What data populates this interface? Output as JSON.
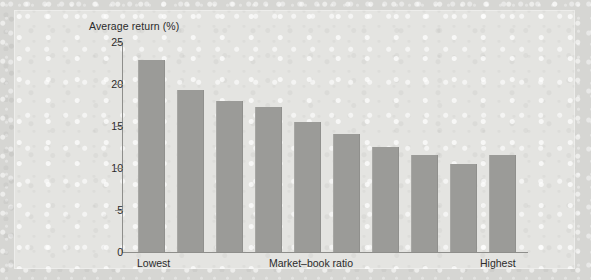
{
  "figure": {
    "background_color": "#d6d6d3",
    "panel_color": "#e4e4e1",
    "bar_color": "#9b9b98",
    "axis_color": "#8e8e8b"
  },
  "chart_data": {
    "type": "bar",
    "title": "",
    "ylabel": "Average return (%)",
    "xlabel": "Market–book ratio",
    "ylim": [
      0,
      25
    ],
    "yticks": [
      0,
      5,
      10,
      15,
      20,
      25
    ],
    "ytick_labels": [
      "0",
      "5",
      "10",
      "15",
      "20",
      "25"
    ],
    "grid": false,
    "legend": null,
    "x_axis_endpoint_labels": {
      "left": "Lowest",
      "center": "Market–book ratio",
      "right": "Highest"
    },
    "categories": [
      "1",
      "2",
      "3",
      "4",
      "5",
      "6",
      "7",
      "8",
      "9",
      "10"
    ],
    "values": [
      22.8,
      19.3,
      18.0,
      17.3,
      15.5,
      14.0,
      12.5,
      11.6,
      10.5,
      11.5
    ],
    "series": [
      {
        "name": "Average return (%)",
        "values": [
          22.8,
          19.3,
          18.0,
          17.3,
          15.5,
          14.0,
          12.5,
          11.6,
          10.5,
          11.5
        ]
      }
    ]
  }
}
